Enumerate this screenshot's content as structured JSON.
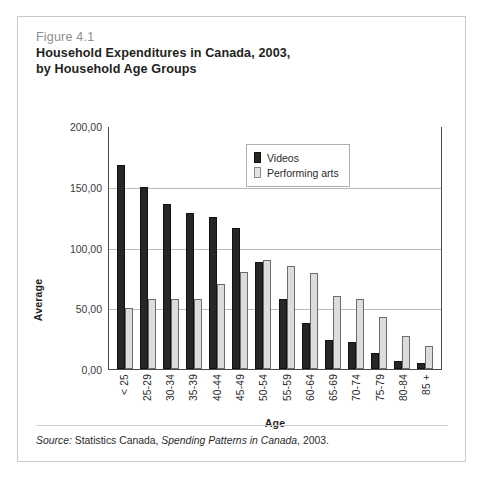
{
  "figure": {
    "number": "Figure 4.1",
    "title_line1": "Household Expenditures in Canada, 2003,",
    "title_line2": "by Household Age Groups",
    "source_prefix": "Source:",
    "source_text_1": " Statistics Canada, ",
    "source_italic": "Spending Patterns in Canada",
    "source_text_2": ", 2003."
  },
  "colors": {
    "videos": "#262626",
    "performing_arts": "#dcdcdc",
    "frame": "#c9c9c9",
    "axis": "#4a4a4a",
    "gridline": "#b9b9b9",
    "figure_number": "#8e8e8e"
  },
  "chart_data": {
    "type": "bar",
    "title": "Household Expenditures in Canada, 2003, by Household Age Groups",
    "subtitle": "Figure 4.1",
    "xlabel": "Age",
    "ylabel": "Average",
    "ylim": [
      0,
      200
    ],
    "ytick_labels": [
      "200,00",
      "150,00",
      "100,00",
      "50,00",
      "0,00"
    ],
    "ytick_values": [
      200,
      150,
      100,
      50,
      0
    ],
    "grid": true,
    "legend_position": "top-right-inside",
    "categories": [
      "< 25",
      "25-29",
      "30-34",
      "35-39",
      "40-44",
      "45-49",
      "50-54",
      "55-59",
      "60-64",
      "65-69",
      "70-74",
      "75-79",
      "80-84",
      "85 +"
    ],
    "series": [
      {
        "name": "Videos",
        "color": "#262626",
        "values": [
          168,
          150,
          136,
          128,
          125,
          116,
          88,
          58,
          38,
          24,
          22,
          13,
          7,
          5
        ]
      },
      {
        "name": "Performing arts",
        "color": "#dcdcdc",
        "values": [
          50,
          58,
          58,
          58,
          70,
          80,
          90,
          85,
          79,
          60,
          58,
          43,
          27,
          19
        ]
      }
    ]
  }
}
